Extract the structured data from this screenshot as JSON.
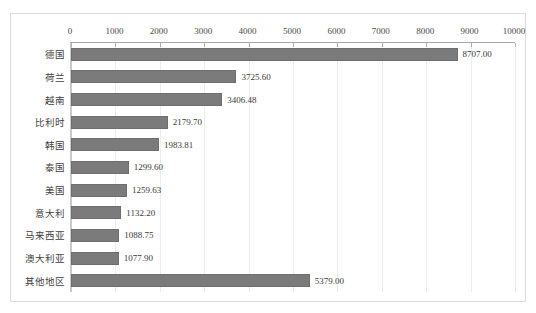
{
  "chart_data": {
    "type": "bar",
    "orientation": "horizontal",
    "title": "",
    "subtitle": "",
    "xlabel": "",
    "ylabel": "",
    "xlim": [
      0,
      10000
    ],
    "xtick_step": 1000,
    "xticks": [
      "0",
      "1000",
      "2000",
      "3000",
      "4000",
      "5000",
      "6000",
      "7000",
      "8000",
      "9000",
      "10000"
    ],
    "grid": true,
    "legend": false,
    "legend_position": "none",
    "categories": [
      "德国",
      "荷兰",
      "越南",
      "比利时",
      "韩国",
      "泰国",
      "美国",
      "意大利",
      "马来西亚",
      "澳大利亚",
      "其他地区"
    ],
    "values": [
      8707.0,
      3725.6,
      3406.48,
      2179.7,
      1983.81,
      1299.6,
      1259.63,
      1132.2,
      1088.75,
      1077.9,
      5379.0
    ],
    "data_labels": [
      "8707.00",
      "3725.60",
      "3406.48",
      "2179.70",
      "1983.81",
      "1299.60",
      "1259.63",
      "1132.20",
      "1088.75",
      "1077.90",
      "5379.00"
    ],
    "series": [
      {
        "name": "",
        "values": [
          8707.0,
          3725.6,
          3406.48,
          2179.7,
          1983.81,
          1299.6,
          1259.63,
          1132.2,
          1088.75,
          1077.9,
          5379.0
        ]
      }
    ]
  },
  "style": {
    "bar_color": "#7b7b7b",
    "bar_border_color": "#6e6e6e",
    "grid_color": "#ececec",
    "axis_color": "#a6a6a6",
    "frame_color": "#dcdcdc",
    "background": "#ffffff",
    "text_color": "#3a3a3a"
  }
}
